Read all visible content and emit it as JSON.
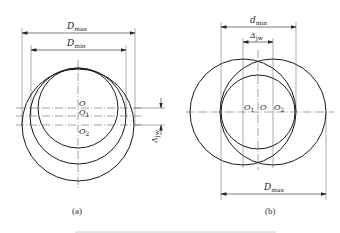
{
  "figure_a": {
    "caption": "(a)",
    "labels": {
      "D_max": {
        "main": "D",
        "sub": "max"
      },
      "D_min": {
        "main": "D",
        "sub": "min"
      },
      "O": "O",
      "O1": {
        "main": "O",
        "sub": "1"
      },
      "O2": {
        "main": "O",
        "sub": "2"
      },
      "delta_jw": {
        "main": "Δ",
        "sub": "jw"
      }
    }
  },
  "figure_b": {
    "caption": "(b)",
    "labels": {
      "d_min": {
        "main": "d",
        "sub": "min"
      },
      "delta_jw": {
        "main": "Δ",
        "sub": "jw"
      },
      "O1": {
        "main": "O",
        "sub": "1"
      },
      "O": "O",
      "O2": {
        "main": "O",
        "sub": "2"
      },
      "D_max": {
        "main": "D",
        "sub": "max"
      }
    }
  },
  "colors": {
    "line": "#1a1a1a",
    "thin": "#444444",
    "rule": "#cccccc"
  }
}
